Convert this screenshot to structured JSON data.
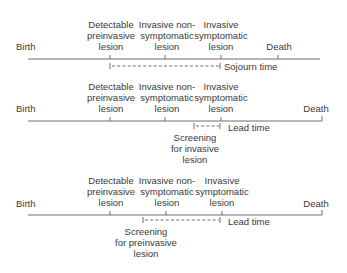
{
  "panels": [
    {
      "id": "sojourn",
      "birth": "Birth",
      "events": [
        {
          "label": "Detectable\npreinvasive\nlesion"
        },
        {
          "label": "Invasive non-\nsymptomatic\nlesion"
        },
        {
          "label": "Invasive\nsymptomatic\nlesion"
        },
        {
          "label": "Death"
        }
      ],
      "interval_label": "Sojourn time",
      "screening_label": ""
    },
    {
      "id": "lead-invasive",
      "birth": "Birth",
      "events": [
        {
          "label": "Detectable\npreinvasive\nlesion"
        },
        {
          "label": "Invasive non-\nsymptomatic\nlesion"
        },
        {
          "label": "Invasive\nsymptomatic\nlesion"
        },
        {
          "label": "Death"
        }
      ],
      "interval_label": "Lead time",
      "screening_label": "Screening\nfor invasive\nlesion"
    },
    {
      "id": "lead-preinvasive",
      "birth": "Birth",
      "events": [
        {
          "label": "Detectable\npreinvasive\nlesion"
        },
        {
          "label": "Invasive non-\nsymptomatic\nlesion"
        },
        {
          "label": "Invasive\nsymptomatic\nlesion"
        },
        {
          "label": "Death"
        }
      ],
      "interval_label": "Lead time",
      "screening_label": "Screening\nfor preinvasive\nlesion"
    }
  ],
  "colors": {
    "line": "#6e6e6e",
    "text": "#3a3a3a"
  }
}
